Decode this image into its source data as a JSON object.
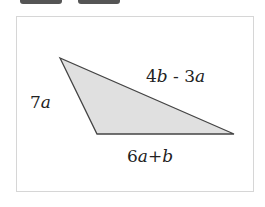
{
  "toolbar": {
    "buttons": [
      {
        "label": ""
      },
      {
        "label": ""
      }
    ]
  },
  "diagram": {
    "shape": "triangle",
    "fill_color": "#e0e0e0",
    "stroke_color": "#444444",
    "vertices": [
      [
        60,
        58
      ],
      [
        97,
        134
      ],
      [
        234,
        134
      ]
    ],
    "sides": {
      "left": {
        "coef": "7",
        "var": "a",
        "text": "7a"
      },
      "top": {
        "text": "4b - 3a",
        "p1": "4",
        "v1": "b",
        "op": " - ",
        "p2": "3",
        "v2": "a"
      },
      "bottom": {
        "text": "6a+b",
        "p1": "6",
        "v1": "a",
        "op": "+",
        "v2": "b"
      }
    }
  }
}
